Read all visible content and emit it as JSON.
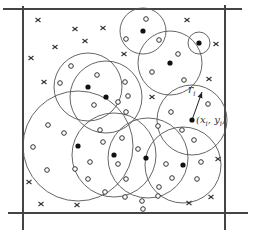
{
  "diagram": {
    "colors": {
      "stroke": "#555555",
      "frame": "#444444",
      "fill_dot": "#111111",
      "background": "#ffffff"
    },
    "frame": {
      "x": 23,
      "y": 9,
      "width": 202,
      "height": 204
    },
    "axis_lines": [
      {
        "x1": 3,
        "y1": 9,
        "x2": 242,
        "y2": 9
      },
      {
        "x1": 23,
        "y1": 6,
        "x2": 23,
        "y2": 230
      },
      {
        "x1": 8,
        "y1": 213,
        "x2": 248,
        "y2": 213
      },
      {
        "x1": 225,
        "y1": 5,
        "x2": 225,
        "y2": 230
      }
    ],
    "circles": [
      {
        "cx": 88,
        "cy": 87,
        "r": 34
      },
      {
        "cx": 106,
        "cy": 97,
        "r": 36
      },
      {
        "cx": 143,
        "cy": 31,
        "r": 23
      },
      {
        "cx": 199,
        "cy": 43,
        "r": 11
      },
      {
        "cx": 170,
        "cy": 63,
        "r": 32
      },
      {
        "cx": 192,
        "cy": 120,
        "r": 35
      },
      {
        "cx": 78,
        "cy": 146,
        "r": 55
      },
      {
        "cx": 114,
        "cy": 155,
        "r": 42
      },
      {
        "cx": 148,
        "cy": 158,
        "r": 40
      },
      {
        "cx": 183,
        "cy": 165,
        "r": 38
      }
    ],
    "centers": [
      {
        "x": 88,
        "y": 87
      },
      {
        "x": 106,
        "y": 97
      },
      {
        "x": 143,
        "y": 31
      },
      {
        "x": 199,
        "y": 43
      },
      {
        "x": 170,
        "y": 63
      },
      {
        "x": 192,
        "y": 120
      },
      {
        "x": 78,
        "y": 146
      },
      {
        "x": 114,
        "y": 155
      },
      {
        "x": 146,
        "y": 158
      },
      {
        "x": 183,
        "y": 165
      }
    ],
    "open_points": [
      {
        "x": 71,
        "y": 66
      },
      {
        "x": 60,
        "y": 83
      },
      {
        "x": 97,
        "y": 75
      },
      {
        "x": 94,
        "y": 105
      },
      {
        "x": 118,
        "y": 102
      },
      {
        "x": 125,
        "y": 82
      },
      {
        "x": 126,
        "y": 112
      },
      {
        "x": 128,
        "y": 96
      },
      {
        "x": 146,
        "y": 19
      },
      {
        "x": 126,
        "y": 39
      },
      {
        "x": 159,
        "y": 40
      },
      {
        "x": 178,
        "y": 54
      },
      {
        "x": 152,
        "y": 72
      },
      {
        "x": 184,
        "y": 80
      },
      {
        "x": 171,
        "y": 112
      },
      {
        "x": 208,
        "y": 104
      },
      {
        "x": 48,
        "y": 125
      },
      {
        "x": 64,
        "y": 133
      },
      {
        "x": 33,
        "y": 147
      },
      {
        "x": 47,
        "y": 170
      },
      {
        "x": 100,
        "y": 130
      },
      {
        "x": 103,
        "y": 142
      },
      {
        "x": 75,
        "y": 169
      },
      {
        "x": 90,
        "y": 162
      },
      {
        "x": 88,
        "y": 179
      },
      {
        "x": 105,
        "y": 192
      },
      {
        "x": 122,
        "y": 138
      },
      {
        "x": 126,
        "y": 179
      },
      {
        "x": 138,
        "y": 149
      },
      {
        "x": 125,
        "y": 197
      },
      {
        "x": 142,
        "y": 201
      },
      {
        "x": 158,
        "y": 126
      },
      {
        "x": 166,
        "y": 164
      },
      {
        "x": 194,
        "y": 140
      },
      {
        "x": 182,
        "y": 130
      },
      {
        "x": 201,
        "y": 162
      },
      {
        "x": 197,
        "y": 179
      },
      {
        "x": 172,
        "y": 178
      },
      {
        "x": 158,
        "y": 196
      },
      {
        "x": 159,
        "y": 187
      },
      {
        "x": 143,
        "y": 209
      },
      {
        "x": 118,
        "y": 164
      }
    ],
    "crosses": [
      {
        "x": 38,
        "y": 20
      },
      {
        "x": 75,
        "y": 29
      },
      {
        "x": 103,
        "y": 28
      },
      {
        "x": 85,
        "y": 41
      },
      {
        "x": 55,
        "y": 47
      },
      {
        "x": 31,
        "y": 58
      },
      {
        "x": 44,
        "y": 82
      },
      {
        "x": 124,
        "y": 54
      },
      {
        "x": 187,
        "y": 20
      },
      {
        "x": 216,
        "y": 44
      },
      {
        "x": 209,
        "y": 79
      },
      {
        "x": 152,
        "y": 97
      },
      {
        "x": 29,
        "y": 182
      },
      {
        "x": 41,
        "y": 204
      },
      {
        "x": 77,
        "y": 205
      },
      {
        "x": 218,
        "y": 159
      },
      {
        "x": 211,
        "y": 197
      },
      {
        "x": 189,
        "y": 203
      }
    ],
    "radius_arrow": {
      "x1": 192,
      "y1": 120,
      "x2": 202,
      "y2": 92
    },
    "labels": {
      "radius": "r",
      "radius_sub": "i",
      "center_label": "(x",
      "center_sub_x": "i",
      "center_mid": ", y",
      "center_sub_y": "i",
      "center_close": ")"
    }
  }
}
